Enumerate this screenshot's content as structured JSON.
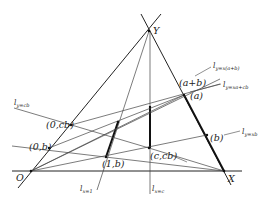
{
  "figure": {
    "type": "geometric construction",
    "vertices": {
      "O": "O",
      "X": "X",
      "Y": "Y"
    },
    "points": {
      "p_0cb": "(0,cb)",
      "p_0b": "(0,b)",
      "p_1b": "(1,b)",
      "p_ccb": "(c,cb)",
      "p_apb": "(a+b)",
      "p_a": "(a)",
      "p_b": "(b)"
    },
    "lines": {
      "l_y_cb": {
        "main": "l",
        "sub": "y=cb"
      },
      "l_y_xab": {
        "main": "l",
        "sub": "y=x(a+b)"
      },
      "l_y_xacb": {
        "main": "l",
        "sub": "y=xa+cb"
      },
      "l_y_xb": {
        "main": "l",
        "sub": "y=xb"
      },
      "l_x_1": {
        "main": "l",
        "sub": "x=1"
      },
      "l_x_c": {
        "main": "l",
        "sub": "x=c"
      }
    },
    "colors": {
      "line": "#333333",
      "thick": "#111111",
      "background": "#ffffff"
    }
  }
}
